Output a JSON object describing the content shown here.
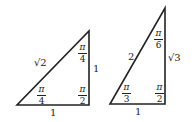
{
  "triangles": [
    {
      "name": "45-45-90",
      "sides": {
        "hypotenuse": "√2",
        "vertical": "1",
        "base": "1"
      },
      "angles": {
        "top": {
          "num": "π",
          "den": "4"
        },
        "bottom_left": {
          "num": "π",
          "den": "4"
        },
        "right_angle": {
          "num": "π",
          "den": "2"
        }
      }
    },
    {
      "name": "30-60-90",
      "sides": {
        "hypotenuse": "2",
        "vertical": "√3",
        "base": "1"
      },
      "angles": {
        "top": {
          "num": "π",
          "den": "6"
        },
        "bottom_left": {
          "num": "π",
          "den": "3"
        },
        "right_angle": {
          "num": "π",
          "den": "2"
        }
      }
    }
  ],
  "colors": {
    "stroke": "#222222",
    "background": "#ffffff"
  }
}
